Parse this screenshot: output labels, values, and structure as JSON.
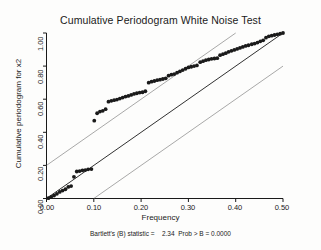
{
  "chart_data": {
    "type": "scatter",
    "title": "Cumulative Periodogram White Noise Test",
    "xlabel": "Frequency",
    "ylabel": "Cumulative periodogram for x2",
    "xlim": [
      0.0,
      0.5
    ],
    "ylim": [
      0.0,
      1.0
    ],
    "grid": false,
    "legend": "none",
    "xticks": [
      "0.00",
      "0.10",
      "0.20",
      "0.30",
      "0.40",
      "0.50"
    ],
    "xtick_values": [
      0.0,
      0.1,
      0.2,
      0.3,
      0.4,
      0.5
    ],
    "yticks": [
      "0.00",
      "0.20",
      "0.40",
      "0.60",
      "0.80",
      "1.00"
    ],
    "ytick_values": [
      0.0,
      0.2,
      0.4,
      0.6,
      0.8,
      1.0
    ],
    "marker": "filled-circle",
    "marker_color": "#1a1a1a",
    "series": [
      {
        "name": "Cumulative periodogram",
        "x": [
          0.004,
          0.01,
          0.016,
          0.022,
          0.028,
          0.034,
          0.04,
          0.046,
          0.052,
          0.058,
          0.064,
          0.07,
          0.076,
          0.082,
          0.088,
          0.095,
          0.101,
          0.107,
          0.113,
          0.119,
          0.125,
          0.131,
          0.137,
          0.143,
          0.149,
          0.155,
          0.161,
          0.167,
          0.173,
          0.179,
          0.185,
          0.191,
          0.197,
          0.203,
          0.209,
          0.216,
          0.222,
          0.228,
          0.234,
          0.24,
          0.246,
          0.252,
          0.258,
          0.264,
          0.27,
          0.276,
          0.282,
          0.288,
          0.294,
          0.3,
          0.306,
          0.312,
          0.318,
          0.325,
          0.331,
          0.337,
          0.343,
          0.349,
          0.355,
          0.361,
          0.367,
          0.373,
          0.379,
          0.385,
          0.391,
          0.397,
          0.403,
          0.409,
          0.415,
          0.421,
          0.427,
          0.434,
          0.44,
          0.446,
          0.452,
          0.458,
          0.464,
          0.47,
          0.476,
          0.482,
          0.488,
          0.494,
          0.5
        ],
        "y": [
          0.002,
          0.01,
          0.018,
          0.028,
          0.04,
          0.048,
          0.056,
          0.07,
          0.075,
          0.131,
          0.163,
          0.166,
          0.17,
          0.172,
          0.176,
          0.178,
          0.47,
          0.515,
          0.525,
          0.53,
          0.54,
          0.585,
          0.59,
          0.594,
          0.598,
          0.604,
          0.61,
          0.616,
          0.62,
          0.626,
          0.632,
          0.636,
          0.64,
          0.642,
          0.648,
          0.7,
          0.706,
          0.71,
          0.715,
          0.718,
          0.722,
          0.726,
          0.742,
          0.748,
          0.752,
          0.76,
          0.768,
          0.776,
          0.784,
          0.792,
          0.796,
          0.8,
          0.804,
          0.824,
          0.83,
          0.836,
          0.84,
          0.844,
          0.846,
          0.848,
          0.866,
          0.872,
          0.878,
          0.886,
          0.892,
          0.898,
          0.904,
          0.91,
          0.916,
          0.922,
          0.926,
          0.932,
          0.936,
          0.942,
          0.95,
          0.956,
          0.972,
          0.98,
          0.984,
          0.988,
          0.992,
          0.996,
          1.0
        ]
      }
    ],
    "reference_lines": [
      {
        "name": "upper-confidence-band",
        "x1": 0.0,
        "y1": 0.2,
        "x2": 0.4,
        "y2": 1.0
      },
      {
        "name": "diagonal-reference-line",
        "x1": 0.0,
        "y1": 0.0,
        "x2": 0.5,
        "y2": 1.0
      },
      {
        "name": "lower-confidence-band",
        "x1": 0.1,
        "y1": 0.0,
        "x2": 0.5,
        "y2": 0.8
      }
    ],
    "annotations": {
      "bartlett_label": "Bartlett's (B) statistic =",
      "bartlett_value": "2.34",
      "prob_label": "Prob > B =",
      "prob_value": "0.0000",
      "full_text": "Bartlett's (B) statistic =     2.34   Prob > B = 0.0000"
    }
  }
}
